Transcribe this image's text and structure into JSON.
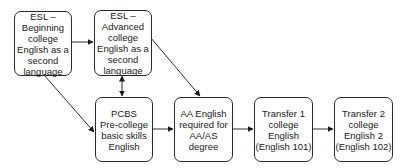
{
  "diagram": {
    "nodes": [
      {
        "id": "esl-beginning",
        "lines": [
          "ESL –",
          "Beginning",
          "college",
          "English as a",
          "second",
          "language"
        ]
      },
      {
        "id": "esl-advanced",
        "lines": [
          "ESL –",
          "Advanced",
          "college",
          "English as a",
          "second",
          "language"
        ]
      },
      {
        "id": "pcbs",
        "lines": [
          "PCBS",
          "Pre-college",
          "basic skills",
          "English"
        ]
      },
      {
        "id": "aa-english",
        "lines": [
          "AA English",
          "required for",
          "AA/AS",
          "degree"
        ]
      },
      {
        "id": "transfer-1",
        "lines": [
          "Transfer 1",
          "college",
          "English",
          "(English 101)"
        ]
      },
      {
        "id": "transfer-2",
        "lines": [
          "Transfer 2",
          "college",
          "English 2",
          "(English 102)"
        ]
      }
    ],
    "edges": [
      {
        "from": "esl-beginning",
        "to": "esl-advanced",
        "type": "directed"
      },
      {
        "from": "esl-beginning",
        "to": "pcbs",
        "type": "directed"
      },
      {
        "from": "esl-advanced",
        "to": "pcbs",
        "type": "bidirectional"
      },
      {
        "from": "esl-advanced",
        "to": "aa-english",
        "type": "directed"
      },
      {
        "from": "pcbs",
        "to": "aa-english",
        "type": "directed"
      },
      {
        "from": "aa-english",
        "to": "transfer-1",
        "type": "directed"
      },
      {
        "from": "transfer-1",
        "to": "transfer-2",
        "type": "directed"
      }
    ]
  }
}
